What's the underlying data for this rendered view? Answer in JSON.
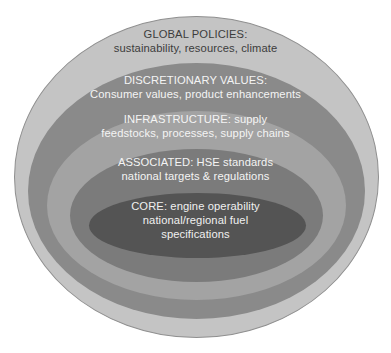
{
  "diagram": {
    "type": "nested-ellipses",
    "layers": [
      {
        "id": "global",
        "title": "GLOBAL POLICIES:",
        "subtitle": "sustainability, resources, climate",
        "color": "#c4c4c4"
      },
      {
        "id": "discretionary",
        "title": "DISCRETIONARY VALUES:",
        "subtitle": "Consumer values, product enhancements",
        "color": "#8a8a8a"
      },
      {
        "id": "infrastructure",
        "title": "INFRASTRUCTURE: supply",
        "subtitle": "feedstocks, processes, supply chains",
        "color": "#a3a3a3"
      },
      {
        "id": "associated",
        "title": "ASSOCIATED: HSE standards",
        "subtitle": "national targets & regulations",
        "color": "#7b7b7b"
      },
      {
        "id": "core",
        "title": "CORE: engine operability",
        "subtitle": "national/regional fuel",
        "subtitle2": "specifications",
        "color": "#545454"
      }
    ]
  }
}
